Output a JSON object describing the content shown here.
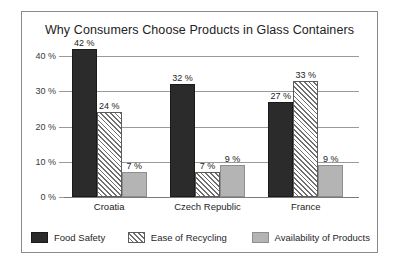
{
  "chart_data": {
    "type": "bar",
    "title": "Why Consumers Choose Products in Glass Containers",
    "xlabel": "",
    "ylabel": "",
    "ylim": [
      0,
      40
    ],
    "grid": true,
    "legend_position": "bottom",
    "value_suffix": " %",
    "categories": [
      "Croatia",
      "Czech Republic",
      "France"
    ],
    "ytick_labels": [
      "0 %",
      "10 %",
      "20 %",
      "30 %",
      "40 %"
    ],
    "ytick_values": [
      0,
      10,
      20,
      30,
      40
    ],
    "series": [
      {
        "name": "Food Safety",
        "swatch": "solid-black",
        "color": "#2b2b2b",
        "values": [
          42,
          32,
          27
        ],
        "labels": [
          "42 %",
          "32 %",
          "27 %"
        ]
      },
      {
        "name": "Ease of Recycling",
        "swatch": "diagonal-hatch",
        "color": "#6f6f6f",
        "values": [
          24,
          7,
          33
        ],
        "labels": [
          "24 %",
          "7 %",
          "33 %"
        ]
      },
      {
        "name": "Availability of Products",
        "swatch": "solid-gray",
        "color": "#b4b4b4",
        "values": [
          7,
          9,
          9
        ],
        "labels": [
          "7 %",
          "9 %",
          "9 %"
        ]
      }
    ]
  }
}
